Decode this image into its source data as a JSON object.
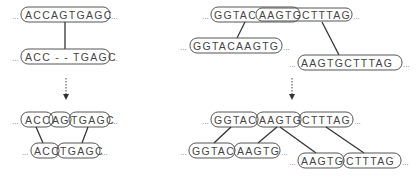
{
  "left_panel": {
    "before": {
      "top_sequence": "ACCAGTGAGC",
      "bottom_sequence": "ACC - - TGAGC"
    },
    "after": {
      "top_segments": [
        "ACC",
        "AG",
        "TGAGC"
      ],
      "bottom_segments": [
        "ACC",
        "TGAGC"
      ]
    }
  },
  "right_panel": {
    "before": {
      "top_segments": [
        "GGTAC",
        "AAGTG",
        "CTTTAG"
      ],
      "bottom_left_sequence": "GGTACAAGTG",
      "bottom_right_sequence": "AAGTGCTTTAG"
    },
    "after": {
      "top_segments": [
        "GGTAC",
        "AAGTG",
        "CTTTAG"
      ],
      "bottom_left_segments": [
        "GGTAC",
        "AAGTG"
      ],
      "bottom_right_segments": [
        "AAGTG",
        "CTTTAG"
      ]
    }
  },
  "ellipsis": "..."
}
